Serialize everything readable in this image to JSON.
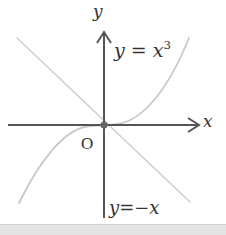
{
  "diagram": {
    "axes": {
      "x_label": "x",
      "y_label": "y",
      "origin_label": "O"
    },
    "curves": [
      {
        "name": "cubic",
        "equation_lhs": "y = x",
        "equation_exp": "3",
        "color": "#c8c8c8"
      },
      {
        "name": "line",
        "equation": "y=−x",
        "color": "#d0d0d0"
      }
    ],
    "colors": {
      "axis": "#555555",
      "text": "#333333",
      "origin_dot": "#666666",
      "bottom_bar": "#e3e3e3"
    }
  }
}
